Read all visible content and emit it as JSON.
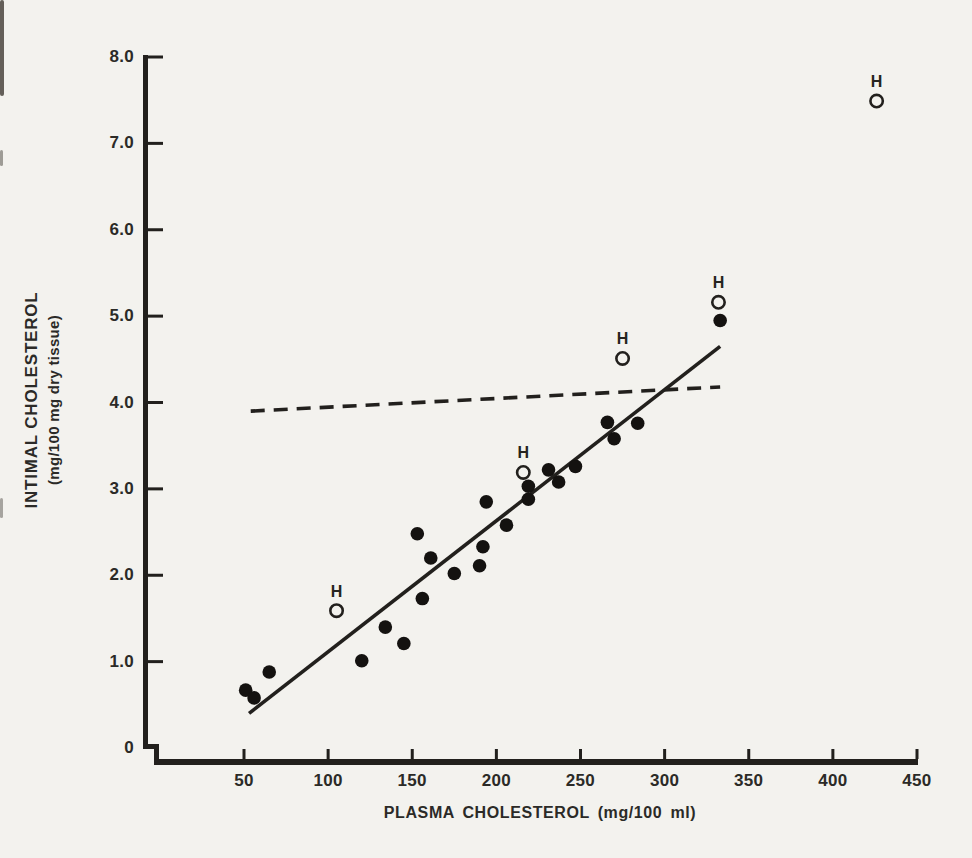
{
  "figure": {
    "x_axis_title": "PLASMA CHOLESTEROL (mg/100 ml)",
    "y_axis_title_line1": "INTIMAL CHOLESTEROL",
    "y_axis_title_line2": "(mg/100 mg dry tissue)"
  },
  "chart_data": {
    "type": "scatter",
    "title": "",
    "xlabel": "PLASMA CHOLESTEROL (mg/100 ml)",
    "ylabel": "INTIMAL CHOLESTEROL (mg/100 mg dry tissue)",
    "xlim": [
      0,
      450
    ],
    "ylim": [
      0,
      8.0
    ],
    "grid": false,
    "x_ticks": [
      50,
      100,
      150,
      200,
      250,
      300,
      350,
      400,
      450
    ],
    "y_ticks": [
      {
        "v": 0,
        "label": "0"
      },
      {
        "v": 1,
        "label": "1.0"
      },
      {
        "v": 2,
        "label": "2.0"
      },
      {
        "v": 3,
        "label": "3.0"
      },
      {
        "v": 4,
        "label": "4.0"
      },
      {
        "v": 5,
        "label": "5.0"
      },
      {
        "v": 6,
        "label": "6.0"
      },
      {
        "v": 7,
        "label": "7.0"
      },
      {
        "v": 8,
        "label": "8.0"
      }
    ],
    "series": [
      {
        "name": "control-animals",
        "marker": "filled-circle",
        "label": "",
        "points": [
          [
            51,
            0.67
          ],
          [
            56,
            0.58
          ],
          [
            65,
            0.88
          ],
          [
            120,
            1.01
          ],
          [
            134,
            1.4
          ],
          [
            145,
            1.21
          ],
          [
            153,
            2.48
          ],
          [
            156,
            1.73
          ],
          [
            161,
            2.2
          ],
          [
            175,
            2.02
          ],
          [
            190,
            2.11
          ],
          [
            192,
            2.33
          ],
          [
            194,
            2.85
          ],
          [
            206,
            2.58
          ],
          [
            219,
            2.88
          ],
          [
            219,
            3.03
          ],
          [
            231,
            3.22
          ],
          [
            237,
            3.08
          ],
          [
            247,
            3.26
          ],
          [
            266,
            3.77
          ],
          [
            270,
            3.58
          ],
          [
            284,
            3.76
          ],
          [
            333,
            4.95
          ]
        ]
      },
      {
        "name": "H-animals",
        "marker": "open-circle",
        "label": "H",
        "points": [
          [
            105,
            1.59
          ],
          [
            216,
            3.19
          ],
          [
            275,
            4.51
          ],
          [
            332,
            5.16
          ],
          [
            426,
            7.49
          ]
        ]
      }
    ],
    "lines": [
      {
        "name": "regression-line",
        "style": "solid",
        "from": [
          53,
          0.4
        ],
        "to": [
          333,
          4.65
        ]
      },
      {
        "name": "reference-line",
        "style": "dashed",
        "from": [
          54,
          3.9
        ],
        "to": [
          333,
          4.18
        ]
      }
    ],
    "colors": {
      "ink": "#22201d",
      "paper": "#f3f2ee"
    }
  }
}
